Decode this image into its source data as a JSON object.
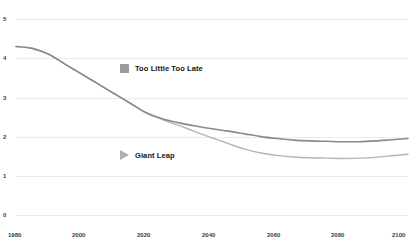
{
  "chart_data": {
    "type": "line",
    "title": "",
    "subtitle": "",
    "xlabel": "",
    "ylabel": "",
    "xlim": [
      1980,
      2100
    ],
    "ylim": [
      0,
      5
    ],
    "grid": true,
    "legend_position": "inside-plot",
    "x_ticks": [
      "1980",
      "2000",
      "2020",
      "2040",
      "2060",
      "2080",
      "2100"
    ],
    "y_ticks": [
      "0",
      "1",
      "2",
      "3",
      "4",
      "5"
    ],
    "x": [
      1980,
      1985,
      1990,
      1995,
      2000,
      2005,
      2010,
      2015,
      2020,
      2025,
      2030,
      2035,
      2040,
      2045,
      2050,
      2055,
      2060,
      2065,
      2070,
      2075,
      2080,
      2085,
      2090,
      2095,
      2100
    ],
    "series": [
      {
        "name": "Too Little Too Late",
        "marker": "square",
        "color": "#8a8a8a",
        "values": [
          4.3,
          4.25,
          4.1,
          3.85,
          3.6,
          3.35,
          3.1,
          2.85,
          2.6,
          2.45,
          2.35,
          2.27,
          2.2,
          2.14,
          2.07,
          2.0,
          1.95,
          1.91,
          1.89,
          1.88,
          1.87,
          1.87,
          1.89,
          1.92,
          1.95
        ]
      },
      {
        "name": "Giant Leap",
        "marker": "triangle",
        "color": "#b5b5b5",
        "values": [
          4.3,
          4.25,
          4.1,
          3.85,
          3.6,
          3.35,
          3.1,
          2.85,
          2.6,
          2.43,
          2.28,
          2.12,
          1.97,
          1.82,
          1.68,
          1.58,
          1.52,
          1.48,
          1.46,
          1.45,
          1.44,
          1.45,
          1.47,
          1.51,
          1.55
        ]
      }
    ],
    "legend": [
      {
        "label": "Too Little Too Late",
        "marker": "square",
        "color": "#9b9b9b"
      },
      {
        "label": "Giant Leap",
        "marker": "triangle",
        "color": "#b0b0b0"
      }
    ],
    "colors": {
      "gridline": "#eceaea",
      "tick_text": "#3d3d3d",
      "legend_text": "#141414",
      "background": "#ffffff"
    }
  }
}
